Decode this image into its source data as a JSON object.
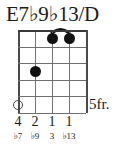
{
  "chord": {
    "name": "E7♭9♭13/D",
    "position_label": "5fr.",
    "strings_count": 5,
    "frets_count": 5
  },
  "colors": {
    "ink": "#111111",
    "grid": "#6f6f6f",
    "grid_edge": "#4a4a4a",
    "background": "#ffffff"
  },
  "diagram": {
    "dots": [
      {
        "name": "dot-string-3-fret-1",
        "string": 3,
        "fret": 1,
        "type": "filled"
      },
      {
        "name": "dot-string-4-fret-1",
        "string": 4,
        "fret": 1,
        "type": "filled"
      },
      {
        "name": "dot-string-2-fret-3",
        "string": 2,
        "fret": 3,
        "type": "filled"
      },
      {
        "name": "dot-string-1-fret-5",
        "string": 1,
        "fret": 5,
        "type": "open"
      }
    ],
    "barre": {
      "from_string": 3,
      "to_string": 4,
      "fret": 1
    }
  },
  "fingers": [
    {
      "string": 1,
      "label": "4"
    },
    {
      "string": 2,
      "label": "2"
    },
    {
      "string": 3,
      "label": "1"
    },
    {
      "string": 4,
      "label": "1"
    }
  ],
  "intervals": [
    {
      "string": 1,
      "label": "♭7"
    },
    {
      "string": 2,
      "label": "♭9"
    },
    {
      "string": 3,
      "label": "3"
    },
    {
      "string": 4,
      "label": "♭13"
    }
  ]
}
